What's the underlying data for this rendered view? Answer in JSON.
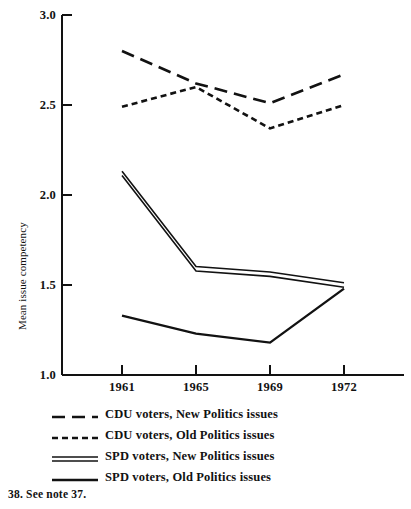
{
  "chart_data": {
    "type": "line",
    "title": "",
    "xlabel": "",
    "ylabel": "Mean issue competency",
    "categories": [
      "1961",
      "1965",
      "1969",
      "1972"
    ],
    "x": [
      1961,
      1965,
      1969,
      1972
    ],
    "ylim": [
      1.0,
      3.0
    ],
    "yticks": [
      "1.0",
      "1.5",
      "2.0",
      "2.5",
      "3.0"
    ],
    "ytick_values": [
      1.0,
      1.5,
      2.0,
      2.5,
      3.0
    ],
    "grid": false,
    "legend_position": "below-axes",
    "series": [
      {
        "name": "CDU voters, New Politics issues",
        "style": "long-dash",
        "values": [
          2.8,
          2.62,
          2.51,
          2.67
        ]
      },
      {
        "name": "CDU voters, Old Politics issues",
        "style": "short-dash",
        "values": [
          2.49,
          2.6,
          2.37,
          2.5
        ]
      },
      {
        "name": "SPD voters, New Politics issues",
        "style": "double-solid",
        "values": [
          2.12,
          1.59,
          1.56,
          1.5
        ]
      },
      {
        "name": "SPD voters, Old Politics issues",
        "style": "solid",
        "values": [
          1.33,
          1.23,
          1.18,
          1.48
        ]
      }
    ]
  },
  "legend": {
    "items": [
      {
        "label": "CDU voters, New Politics issues",
        "style": "long-dash"
      },
      {
        "label": "CDU voters, Old Politics issues",
        "style": "short-dash"
      },
      {
        "label": "SPD voters, New Politics issues",
        "style": "double-solid"
      },
      {
        "label": "SPD voters, Old Politics issues",
        "style": "solid"
      }
    ]
  },
  "footnote": "38.  See note 37.",
  "colors": {
    "ink": "#121212",
    "background": "#ffffff"
  }
}
